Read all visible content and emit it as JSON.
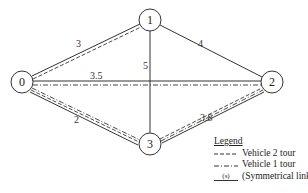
{
  "diagram": {
    "nodes": [
      {
        "id": "0",
        "label": "0",
        "x": 22,
        "y": 82
      },
      {
        "id": "1",
        "label": "1",
        "x": 150,
        "y": 20
      },
      {
        "id": "2",
        "label": "2",
        "x": 272,
        "y": 82
      },
      {
        "id": "3",
        "label": "3",
        "x": 150,
        "y": 144
      }
    ],
    "edges": [
      {
        "from": "0",
        "to": "1",
        "cost": "3",
        "tour": "vehicle2"
      },
      {
        "from": "1",
        "to": "2",
        "cost": "4",
        "tour": "none"
      },
      {
        "from": "1",
        "to": "3",
        "cost": "5",
        "tour": "none"
      },
      {
        "from": "0",
        "to": "2",
        "cost": "3.5",
        "tour": "vehicle1"
      },
      {
        "from": "0",
        "to": "3",
        "cost": "2",
        "tour": "vehicle1+vehicle2"
      },
      {
        "from": "3",
        "to": "2",
        "cost": "3.8",
        "tour": "vehicle1+vehicle2"
      }
    ],
    "edge_labels": {
      "e01": "3",
      "e12": "4",
      "e13": "5",
      "e02": "3.5",
      "e03": "2",
      "e32": "3.8"
    },
    "node_labels": {
      "n0": "0",
      "n1": "1",
      "n2": "2",
      "n3": "3"
    }
  },
  "legend": {
    "title": "Legend",
    "vehicle2": "Vehicle 2 tour",
    "vehicle1": "Vehicle 1 tour",
    "cost_symbol": "(s)",
    "cost": "(Symmetrical link cost)"
  },
  "colors": {
    "line": "#333333",
    "background": "#ffffff"
  }
}
